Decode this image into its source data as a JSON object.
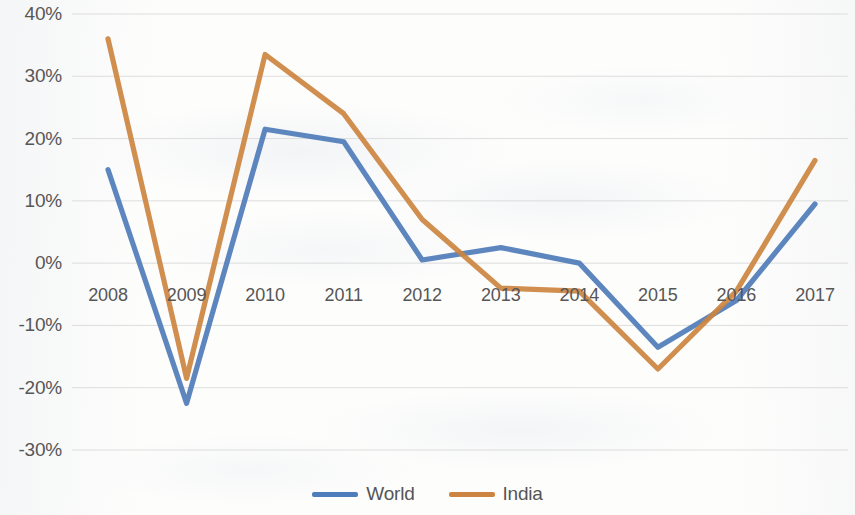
{
  "chart_data": {
    "type": "line",
    "title": "",
    "subtitle": "",
    "xlabel": "",
    "ylabel": "",
    "categories": [
      "2008",
      "2009",
      "2010",
      "2011",
      "2012",
      "2013",
      "2014",
      "2015",
      "2016",
      "2017"
    ],
    "series": [
      {
        "name": "World",
        "color": "#4f7cba",
        "values": [
          15,
          -22.5,
          21.5,
          19.5,
          0.5,
          2.5,
          0,
          -13.5,
          -6,
          9.5
        ]
      },
      {
        "name": "India",
        "color": "#cc8440",
        "values": [
          36,
          -18.5,
          33.5,
          24,
          7,
          -4,
          -4.5,
          -17,
          -4.5,
          16.5
        ]
      }
    ],
    "ylim": [
      -30,
      40
    ],
    "ytick_values": [
      40,
      30,
      20,
      10,
      0,
      -10,
      -20,
      -30
    ],
    "ytick_labels": [
      "40%",
      "30%",
      "20%",
      "10%",
      "0%",
      "-10%",
      "-20%",
      "-30%"
    ],
    "grid": true,
    "grid_color": "#d9d9d9",
    "legend_position": "bottom",
    "legend": [
      "World",
      "India"
    ],
    "annotations": []
  },
  "legend": {
    "items": [
      {
        "label": "World",
        "color": "#4f7cba",
        "icon": "line-swatch"
      },
      {
        "label": "India",
        "color": "#cc8440",
        "icon": "line-swatch"
      }
    ]
  },
  "axes": {
    "y_ticks": [
      "40%",
      "30%",
      "20%",
      "10%",
      "0%",
      "-10%",
      "-20%",
      "-30%"
    ],
    "x_ticks": [
      "2008",
      "2009",
      "2010",
      "2011",
      "2012",
      "2013",
      "2014",
      "2015",
      "2016",
      "2017"
    ]
  }
}
